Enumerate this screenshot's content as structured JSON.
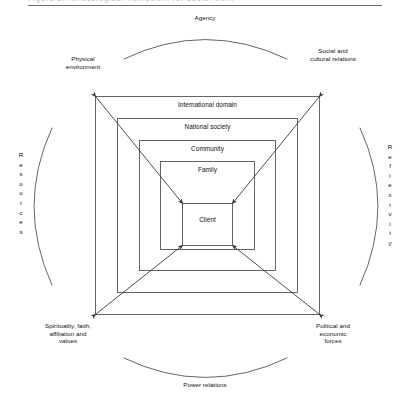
{
  "figure": {
    "title_fragment": "Figure 1. An ecological framework for social work",
    "center_label": "Client",
    "nested_layers": [
      {
        "label": "International domain"
      },
      {
        "label": "National society"
      },
      {
        "label": "Community"
      },
      {
        "label": "Family"
      },
      {
        "label": "Client"
      }
    ],
    "arcs": [
      {
        "name": "top-arc",
        "label": "Agency",
        "position": "top"
      },
      {
        "name": "bottom-arc",
        "label": "Power relations",
        "position": "bottom"
      },
      {
        "name": "left-arc",
        "label": "Resources",
        "position": "left",
        "orientation": "vertical-letters"
      },
      {
        "name": "right-arc",
        "label": "Reflexivity",
        "position": "right",
        "orientation": "vertical-letters"
      }
    ],
    "corner_labels": [
      {
        "name": "top-left",
        "label": "Physical\nenvironment"
      },
      {
        "name": "top-right",
        "label": "Social and\ncultural relations"
      },
      {
        "name": "bottom-left",
        "label": "Spirituality, faith,\naffiliation and\nvalues"
      },
      {
        "name": "bottom-right",
        "label": "Political and\neconomic\nforces"
      }
    ],
    "arrows": {
      "count": 4,
      "direction": "outer-corners-to-client-box",
      "description": "Diagonal double-headed arrows linking the four outer corners with the four corners of the Client box"
    },
    "colors": {
      "line": "#3a3a3a",
      "text": "#111111",
      "background": "#ffffff",
      "rule": "#6e6e72"
    }
  }
}
